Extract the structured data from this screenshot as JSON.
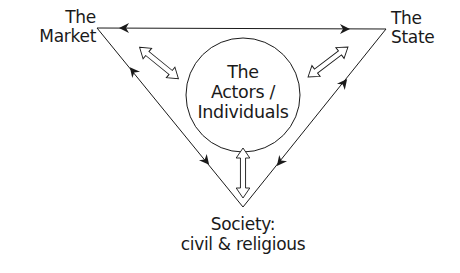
{
  "diagram": {
    "title": "",
    "nodes": {
      "market": {
        "line1": "The",
        "line2": "Market"
      },
      "state": {
        "line1": "The",
        "line2": "State"
      },
      "society": {
        "line1": "Society:",
        "line2": "civil & religious"
      },
      "actors": {
        "line1": "The",
        "line2": "Actors /",
        "line3": "Individuals"
      }
    },
    "edges": [
      {
        "from": "market",
        "to": "state",
        "style": "line with arrowheads in both directions"
      },
      {
        "from": "market",
        "to": "society",
        "style": "line with arrowheads in both directions"
      },
      {
        "from": "state",
        "to": "society",
        "style": "line with arrowheads in both directions"
      },
      {
        "from": "actors",
        "to": "market",
        "style": "hollow double-headed arrow"
      },
      {
        "from": "actors",
        "to": "state",
        "style": "hollow double-headed arrow"
      },
      {
        "from": "actors",
        "to": "society",
        "style": "hollow double-headed arrow"
      }
    ],
    "colors": {
      "stroke": "#1a1a1a",
      "background": "#ffffff"
    }
  }
}
